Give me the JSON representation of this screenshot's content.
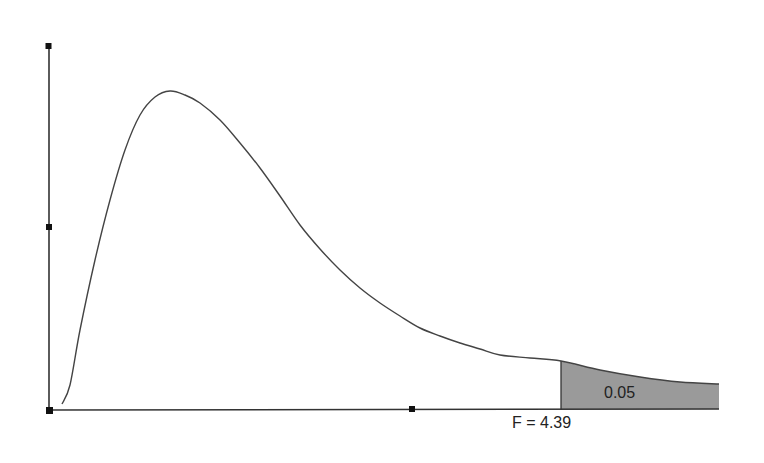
{
  "chart_data": {
    "type": "area",
    "title": "",
    "xlabel": "",
    "ylabel": "",
    "distribution": "F",
    "critical_value_label": "F = 4.39",
    "critical_value": 4.39,
    "shaded_area_label": "0.05",
    "shaded_area": 0.05,
    "grid": false,
    "legend": null,
    "curve_points_px": [
      [
        62,
        404
      ],
      [
        70,
        385
      ],
      [
        80,
        330
      ],
      [
        95,
        260
      ],
      [
        110,
        200
      ],
      [
        125,
        150
      ],
      [
        140,
        115
      ],
      [
        155,
        97
      ],
      [
        170,
        91
      ],
      [
        185,
        95
      ],
      [
        200,
        103
      ],
      [
        220,
        120
      ],
      [
        240,
        143
      ],
      [
        260,
        168
      ],
      [
        280,
        196
      ],
      [
        300,
        225
      ],
      [
        320,
        249
      ],
      [
        340,
        270
      ],
      [
        360,
        288
      ],
      [
        380,
        303
      ],
      [
        400,
        316
      ],
      [
        420,
        328
      ],
      [
        440,
        336
      ],
      [
        460,
        343
      ],
      [
        480,
        349
      ],
      [
        500,
        355
      ],
      [
        530,
        358
      ],
      [
        561,
        361
      ],
      [
        600,
        370
      ],
      [
        640,
        377
      ],
      [
        680,
        382
      ],
      [
        719,
        384
      ]
    ],
    "axes": {
      "origin_px": [
        49,
        410
      ],
      "y_top_px": 46,
      "x_end_px": 719,
      "y_ticks_px": [
        46,
        227,
        410
      ],
      "x_ticks_px": [
        49,
        412
      ]
    },
    "colors": {
      "curve": "#444444",
      "axis": "#333333",
      "shade": "#9a9a9a",
      "tick": "#111111"
    }
  }
}
